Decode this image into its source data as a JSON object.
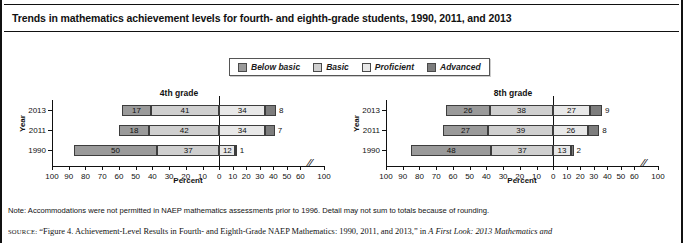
{
  "title": "Trends in mathematics achievement levels for fourth- and eighth-grade students, 1990, 2011, and 2013",
  "legend": {
    "items": [
      {
        "label": "Below basic",
        "color": "#9a9a9a"
      },
      {
        "label": "Basic",
        "color": "#cfcfcf"
      },
      {
        "label": "Proficient",
        "color": "#e8e8e8"
      },
      {
        "label": "Advanced",
        "color": "#7d7d7d"
      }
    ]
  },
  "footer": {
    "note": "Note: Accommodations were not permitted in NAEP mathematics assessments prior to 1996. Detail may not sum to totals because of rounding.",
    "source_label": "SOURCE:",
    "source_quote": "“Figure 4. Achievement-Level Results in Fourth- and Eighth-Grade NAEP Mathematics: 1990, 2011, and 2013,”",
    "source_in": "in",
    "source_italic": "A First Look: 2013 Mathematics and"
  },
  "chart_data": [
    {
      "type": "bar",
      "title": "4th grade",
      "xlabel": "Percent",
      "ylabel": "Year",
      "orientation": "horizontal-diverging-stacked",
      "categories": [
        "2013",
        "2011",
        "1990"
      ],
      "tick_labels_left": [
        "100",
        "90",
        "80",
        "70",
        "60",
        "50",
        "40",
        "30",
        "20",
        "10",
        "0"
      ],
      "tick_labels_right": [
        "0",
        "10",
        "20",
        "30",
        "40",
        "50",
        "60",
        "100"
      ],
      "axis_break": true,
      "series": [
        {
          "name": "Below basic",
          "side": "left",
          "values": [
            17,
            18,
            50
          ]
        },
        {
          "name": "Basic",
          "side": "left",
          "values": [
            41,
            42,
            37
          ]
        },
        {
          "name": "Proficient",
          "side": "right",
          "values": [
            34,
            34,
            12
          ]
        },
        {
          "name": "Advanced",
          "side": "right",
          "values": [
            8,
            7,
            1
          ]
        }
      ]
    },
    {
      "type": "bar",
      "title": "8th grade",
      "xlabel": "Percent",
      "ylabel": "Year",
      "orientation": "horizontal-diverging-stacked",
      "categories": [
        "2013",
        "2011",
        "1990"
      ],
      "tick_labels_left": [
        "100",
        "90",
        "80",
        "70",
        "60",
        "50",
        "40",
        "30",
        "20",
        "10",
        "0"
      ],
      "tick_labels_right": [
        "0",
        "10",
        "20",
        "30",
        "40",
        "50",
        "60",
        "100"
      ],
      "axis_break": true,
      "series": [
        {
          "name": "Below basic",
          "side": "left",
          "values": [
            26,
            27,
            48
          ]
        },
        {
          "name": "Basic",
          "side": "left",
          "values": [
            38,
            39,
            37
          ]
        },
        {
          "name": "Proficient",
          "side": "right",
          "values": [
            27,
            26,
            13
          ]
        },
        {
          "name": "Advanced",
          "side": "right",
          "values": [
            9,
            8,
            2
          ]
        }
      ]
    }
  ]
}
